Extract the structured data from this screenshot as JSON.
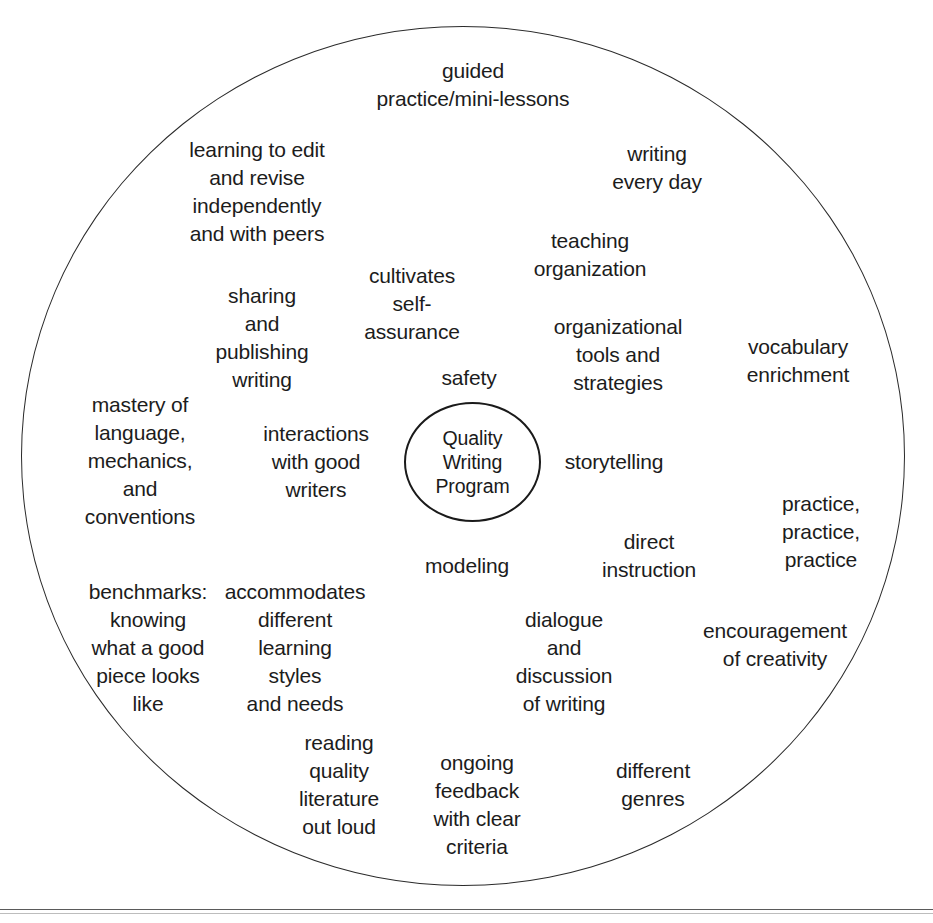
{
  "diagram": {
    "title": "Quality Writing Program",
    "type": "cluster-web-diagram",
    "center": {
      "label": "Quality\nWriting\nProgram"
    },
    "outer_circle": {
      "stroke_color": "#2b2b2b"
    },
    "nodes": [
      {
        "id": "guided-practice",
        "label": "guided\npractice/mini-lessons",
        "x": 473,
        "y": 85
      },
      {
        "id": "learning-to-edit",
        "label": "learning to edit\nand revise\nindependently\nand with peers",
        "x": 257,
        "y": 192
      },
      {
        "id": "writing-every-day",
        "label": "writing\nevery day",
        "x": 657,
        "y": 168
      },
      {
        "id": "teaching-organization",
        "label": "teaching\norganization",
        "x": 590,
        "y": 255
      },
      {
        "id": "cultivates-self-assurance",
        "label": "cultivates\nself-\nassurance",
        "x": 412,
        "y": 304
      },
      {
        "id": "sharing-and-publishing",
        "label": "sharing\nand\npublishing\nwriting",
        "x": 262,
        "y": 338
      },
      {
        "id": "organizational-tools",
        "label": "organizational\ntools and\nstrategies",
        "x": 618,
        "y": 355
      },
      {
        "id": "vocabulary-enrichment",
        "label": "vocabulary\nenrichment",
        "x": 798,
        "y": 361
      },
      {
        "id": "safety",
        "label": "safety",
        "x": 469,
        "y": 378
      },
      {
        "id": "mastery-of-language",
        "label": "mastery of\nlanguage,\nmechanics,\nand\nconventions",
        "x": 140,
        "y": 461
      },
      {
        "id": "interactions-with-good-writers",
        "label": "interactions\nwith good\nwriters",
        "x": 316,
        "y": 462
      },
      {
        "id": "storytelling",
        "label": "storytelling",
        "x": 614,
        "y": 462
      },
      {
        "id": "practice-practice-practice",
        "label": "practice,\npractice,\npractice",
        "x": 821,
        "y": 532
      },
      {
        "id": "direct-instruction",
        "label": "direct\ninstruction",
        "x": 649,
        "y": 556
      },
      {
        "id": "modeling",
        "label": "modeling",
        "x": 467,
        "y": 566
      },
      {
        "id": "benchmarks",
        "label": "benchmarks:\nknowing\nwhat a good\npiece looks\nlike",
        "x": 148,
        "y": 648
      },
      {
        "id": "accommodates-learning-styles",
        "label": "accommodates\ndifferent\nlearning\nstyles\nand needs",
        "x": 295,
        "y": 648
      },
      {
        "id": "dialogue-and-discussion",
        "label": "dialogue\nand\ndiscussion\nof writing",
        "x": 564,
        "y": 662
      },
      {
        "id": "encouragement-of-creativity",
        "label": "encouragement\nof creativity",
        "x": 775,
        "y": 645
      },
      {
        "id": "reading-quality-literature",
        "label": "reading\nquality\nliterature\nout loud",
        "x": 339,
        "y": 785
      },
      {
        "id": "ongoing-feedback",
        "label": "ongoing\nfeedback\nwith clear\ncriteria",
        "x": 477,
        "y": 805
      },
      {
        "id": "different-genres",
        "label": "different\ngenres",
        "x": 653,
        "y": 785
      }
    ]
  }
}
